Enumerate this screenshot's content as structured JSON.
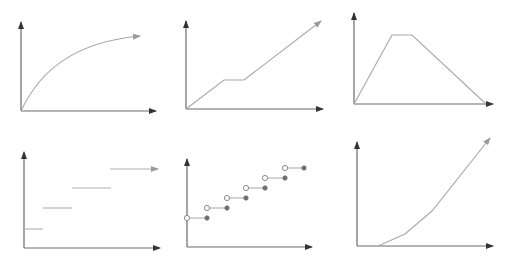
{
  "colors": {
    "axis": "#6a6a6a",
    "curve": "#a8a8a8",
    "open_dot": "#8a8a8a",
    "filled_dot": "#707070",
    "background": "#ffffff"
  },
  "panels": [
    {
      "id": "concave-growth",
      "axes": {
        "origin": [
          21,
          111
        ],
        "y_top": [
          21,
          22
        ],
        "x_end": [
          156,
          111
        ]
      },
      "shape": "curve",
      "path": "M21,111 C40,70 75,42 140,36",
      "arrow_end": true
    },
    {
      "id": "linear-with-plateau",
      "axes": {
        "origin": [
          186,
          109
        ],
        "y_top": [
          186,
          21
        ],
        "x_end": [
          323,
          109
        ]
      },
      "shape": "polyline",
      "points": [
        [
          186,
          109
        ],
        [
          224,
          80
        ],
        [
          244,
          80
        ],
        [
          321,
          21
        ]
      ],
      "arrow_end": true
    },
    {
      "id": "trapezoid",
      "axes": {
        "origin": [
          354,
          104
        ],
        "y_top": [
          354,
          13
        ],
        "x_end": [
          493,
          104
        ]
      },
      "shape": "polyline",
      "points": [
        [
          354,
          104
        ],
        [
          392,
          35
        ],
        [
          412,
          35
        ],
        [
          486,
          104
        ]
      ],
      "arrow_end": false
    },
    {
      "id": "step-function",
      "axes": {
        "origin": [
          24,
          248
        ],
        "y_top": [
          24,
          152
        ],
        "x_end": [
          160,
          248
        ]
      },
      "shape": "steps",
      "segments": [
        [
          [
            25,
            229
          ],
          [
            43,
            229
          ]
        ],
        [
          [
            43,
            208
          ],
          [
            72,
            208
          ]
        ],
        [
          [
            72,
            188
          ],
          [
            111,
            188
          ]
        ],
        [
          [
            110,
            169
          ],
          [
            158,
            169
          ]
        ]
      ],
      "arrow_end": true
    },
    {
      "id": "floor-step-dots",
      "axes": {
        "origin": [
          187,
          247
        ],
        "y_top": [
          187,
          159
        ],
        "x_end": [
          312,
          247
        ]
      },
      "shape": "dotted-steps",
      "segments": [
        {
          "open": [
            187,
            218
          ],
          "filled": [
            207,
            218
          ]
        },
        {
          "open": [
            207,
            208
          ],
          "filled": [
            227,
            208
          ]
        },
        {
          "open": [
            227,
            198
          ],
          "filled": [
            246,
            198
          ]
        },
        {
          "open": [
            246,
            188
          ],
          "filled": [
            265,
            188
          ]
        },
        {
          "open": [
            265,
            178
          ],
          "filled": [
            285,
            178
          ]
        },
        {
          "open": [
            285,
            168
          ],
          "filled": [
            304,
            168
          ]
        }
      ]
    },
    {
      "id": "convex-growth",
      "axes": {
        "origin": [
          357,
          246
        ],
        "y_top": [
          357,
          142
        ],
        "x_end": [
          493,
          246
        ]
      },
      "shape": "polyline",
      "points": [
        [
          378,
          246
        ],
        [
          405,
          234
        ],
        [
          432,
          211
        ],
        [
          490,
          138
        ]
      ],
      "arrow_end": true
    }
  ],
  "chart_data": [
    {
      "type": "line",
      "title": "",
      "xlabel": "",
      "ylabel": "",
      "description": "Concave increasing curve (diminishing growth), ending in arrow",
      "x": [
        0,
        0.2,
        0.4,
        0.6,
        0.8,
        1.0
      ],
      "values": [
        0,
        0.45,
        0.7,
        0.85,
        0.94,
        1.0
      ]
    },
    {
      "type": "line",
      "title": "",
      "xlabel": "",
      "ylabel": "",
      "description": "Linear increase with a flat plateau, then continued linear increase with arrow",
      "x": [
        0,
        0.28,
        0.43,
        1.0
      ],
      "values": [
        0,
        0.33,
        0.33,
        1.0
      ]
    },
    {
      "type": "line",
      "title": "",
      "xlabel": "",
      "ylabel": "",
      "description": "Trapezoid: rise, plateau, fall back to zero",
      "x": [
        0,
        0.29,
        0.44,
        1.0
      ],
      "values": [
        0,
        0.76,
        0.76,
        0
      ]
    },
    {
      "type": "line",
      "title": "",
      "xlabel": "",
      "ylabel": "",
      "description": "Step function with four constant levels, last step with arrow",
      "series": [
        {
          "name": "step1",
          "x": [
            0,
            0.14
          ],
          "values": [
            0.2,
            0.2
          ]
        },
        {
          "name": "step2",
          "x": [
            0.14,
            0.36
          ],
          "values": [
            0.42,
            0.42
          ]
        },
        {
          "name": "step3",
          "x": [
            0.36,
            0.65
          ],
          "values": [
            0.63,
            0.63
          ]
        },
        {
          "name": "step4",
          "x": [
            0.64,
            1.0
          ],
          "values": [
            0.83,
            0.83
          ]
        }
      ]
    },
    {
      "type": "scatter",
      "title": "",
      "xlabel": "",
      "ylabel": "",
      "description": "Staircase: six horizontal segments with open circle at left and filled dot at right",
      "series": [
        {
          "name": "open",
          "x": [
            0,
            1,
            2,
            3,
            4,
            5
          ],
          "values": [
            1,
            2,
            3,
            4,
            5,
            6
          ]
        },
        {
          "name": "filled",
          "x": [
            1,
            2,
            3,
            4,
            5,
            6
          ],
          "values": [
            1,
            2,
            3,
            4,
            5,
            6
          ]
        }
      ]
    },
    {
      "type": "line",
      "title": "",
      "xlabel": "",
      "ylabel": "",
      "description": "Convex increasing curve (accelerating growth) starting offset from origin, ending in arrow",
      "x": [
        0.16,
        0.36,
        0.56,
        1.0
      ],
      "values": [
        0,
        0.12,
        0.34,
        1.0
      ]
    }
  ]
}
